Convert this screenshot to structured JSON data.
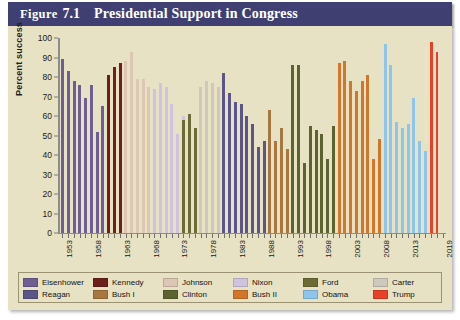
{
  "header": {
    "figure_word": "Figure",
    "figure_number": "7.1",
    "title": "Presidential Support in Congress"
  },
  "chart_data": {
    "type": "bar",
    "title": "Presidential Support in Congress",
    "xlabel": "",
    "ylabel": "Percent success",
    "ylim": [
      0,
      100
    ],
    "ytick_labels": [
      "0",
      "10",
      "20",
      "30",
      "40",
      "50",
      "60",
      "70",
      "80",
      "90",
      "100"
    ],
    "ytick_values": [
      0,
      10,
      20,
      30,
      40,
      50,
      60,
      70,
      80,
      90,
      100
    ],
    "xtick_labels": [
      "1953",
      "1958",
      "1963",
      "1968",
      "1973",
      "1978",
      "1983",
      "1988",
      "1993",
      "1998",
      "2003",
      "2008",
      "2013",
      "2019"
    ],
    "xtick_years": [
      1953,
      1958,
      1963,
      1968,
      1973,
      1978,
      1983,
      1988,
      1993,
      1998,
      2003,
      2008,
      2013,
      2019
    ],
    "x_start": 1953,
    "x_end": 2019,
    "grid": false,
    "legend_position": "bottom",
    "series": [
      {
        "name": "Eisenhower",
        "color": "#6f5e92",
        "years": [
          1953,
          1954,
          1955,
          1956,
          1957,
          1958,
          1959,
          1960
        ],
        "values": [
          89,
          83,
          78,
          76,
          69,
          76,
          52,
          65
        ]
      },
      {
        "name": "Kennedy",
        "color": "#6d1f1c",
        "years": [
          1961,
          1962,
          1963
        ],
        "values": [
          81,
          85,
          87
        ]
      },
      {
        "name": "Johnson",
        "color": "#ddc7b4",
        "years": [
          1964,
          1965,
          1966,
          1967,
          1968
        ],
        "values": [
          88,
          93,
          79,
          79,
          75
        ]
      },
      {
        "name": "Nixon",
        "color": "#cfc3e0",
        "years": [
          1969,
          1970,
          1971,
          1972,
          1973,
          1974
        ],
        "values": [
          74,
          77,
          75,
          66,
          51,
          60
        ]
      },
      {
        "name": "Ford",
        "color": "#6d6b35",
        "years": [
          1974,
          1975,
          1976
        ],
        "values": [
          58,
          61,
          54
        ]
      },
      {
        "name": "Carter",
        "color": "#cfc9bd",
        "years": [
          1977,
          1978,
          1979,
          1980
        ],
        "values": [
          75,
          78,
          77,
          75
        ]
      },
      {
        "name": "Reagan",
        "color": "#5b5687",
        "years": [
          1981,
          1982,
          1983,
          1984,
          1985,
          1986,
          1987,
          1988
        ],
        "values": [
          82,
          72,
          67,
          66,
          60,
          56,
          44,
          47
        ]
      },
      {
        "name": "Bush I",
        "color": "#a8763f",
        "years": [
          1989,
          1990,
          1991,
          1992
        ],
        "values": [
          63,
          47,
          54,
          43
        ]
      },
      {
        "name": "Clinton",
        "color": "#5d6330",
        "years": [
          1993,
          1994,
          1995,
          1996,
          1997,
          1998,
          1999,
          2000
        ],
        "values": [
          86,
          86,
          36,
          55,
          53,
          51,
          38,
          55
        ]
      },
      {
        "name": "Bush II",
        "color": "#d2762c",
        "years": [
          2001,
          2002,
          2003,
          2004,
          2005,
          2006,
          2007,
          2008
        ],
        "values": [
          87,
          88,
          78,
          73,
          78,
          81,
          38,
          48
        ]
      },
      {
        "name": "Obama",
        "color": "#8dc6ea",
        "years": [
          2009,
          2010,
          2011,
          2012,
          2013,
          2014,
          2015,
          2016
        ],
        "values": [
          97,
          86,
          57,
          54,
          56,
          69,
          47,
          42
        ]
      },
      {
        "name": "Trump",
        "color": "#e8412a",
        "years": [
          2017,
          2018
        ],
        "values": [
          98,
          93
        ]
      }
    ]
  },
  "legend": {
    "row1": [
      {
        "label": "Eisenhower",
        "color": "#6f5e92"
      },
      {
        "label": "Kennedy",
        "color": "#6d1f1c"
      },
      {
        "label": "Johnson",
        "color": "#ddc7b4"
      },
      {
        "label": "Nixon",
        "color": "#cfc3e0"
      },
      {
        "label": "Ford",
        "color": "#6d6b35"
      },
      {
        "label": "Carter",
        "color": "#cfc9bd"
      }
    ],
    "row2": [
      {
        "label": "Reagan",
        "color": "#5b5687"
      },
      {
        "label": "Bush I",
        "color": "#a8763f"
      },
      {
        "label": "Clinton",
        "color": "#5d6330"
      },
      {
        "label": "Bush II",
        "color": "#d2762c"
      },
      {
        "label": "Obama",
        "color": "#8dc6ea"
      },
      {
        "label": "Trump",
        "color": "#e8412a"
      }
    ]
  },
  "colors": {
    "title_bar": "#3f3f72",
    "panel_background": "#e8e2c4",
    "axis": "#8c8c8c"
  }
}
